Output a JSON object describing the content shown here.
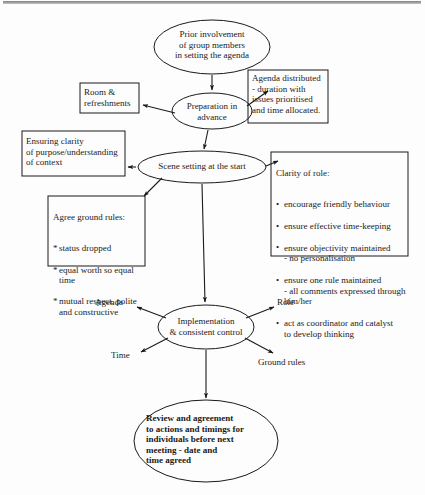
{
  "diagram": {
    "stroke_color": "#1a1a1a",
    "background_color": "#fdfdfd"
  },
  "nodes": {
    "prior_involvement": {
      "shape": "ellipse",
      "text": "Prior involvement\nof group members\nin setting the agenda"
    },
    "preparation": {
      "shape": "ellipse",
      "text": "Preparation  in\nadvance"
    },
    "room_refreshments": {
      "shape": "box",
      "text": "Room &\nrefreshments"
    },
    "agenda_distributed": {
      "shape": "box",
      "text": "Agenda distributed\n - duration with\nissues prioritised\nand time allocated."
    },
    "scene_setting": {
      "shape": "ellipse",
      "text": "Scene setting at the start"
    },
    "ensuring_clarity": {
      "shape": "box",
      "text": "Ensuring clarity\nof purpose/understanding\nof context"
    },
    "clarity_of_role": {
      "shape": "box",
      "heading": "Clarity of role:",
      "bullets": [
        "encourage friendly behaviour",
        "ensure effective time-keeping",
        "ensure objectivity maintained\n - no personalisation",
        "ensure one rule maintained\n - all comments expressed through\nhim/her",
        "act as coordinator and catalyst\nto develop thinking"
      ]
    },
    "agree_ground_rules": {
      "shape": "box",
      "heading": "Agree ground rules:",
      "bullets": [
        "status dropped",
        "equal worth so equal\n time",
        "mutual respect, polite\n and constructive"
      ]
    },
    "implementation": {
      "shape": "ellipse",
      "text": "Implementation\n& consistent control"
    },
    "review_agreement": {
      "shape": "ellipse",
      "text": "Review and agreement\nto actions and timings for\nindividuals before next\nmeeting - date and\ntime agreed"
    }
  },
  "radial_labels": {
    "agenda": "Agenda",
    "role": "Role",
    "time": "Time",
    "ground_rules": "Ground rules"
  }
}
